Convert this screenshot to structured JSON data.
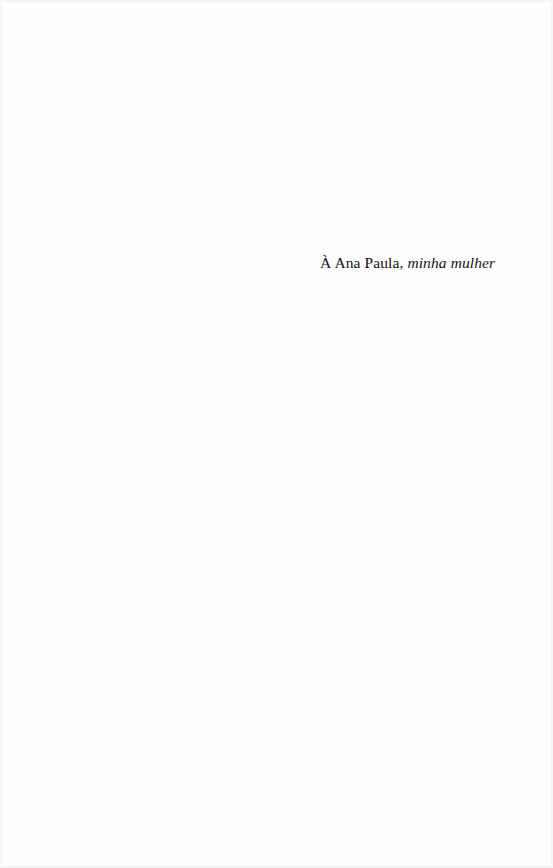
{
  "page": {
    "type": "dedication",
    "background_color": "#fefefe",
    "text_color": "#111111"
  },
  "dedication": {
    "recipient": "À Ana Paula,",
    "relation": "minha mulher"
  }
}
